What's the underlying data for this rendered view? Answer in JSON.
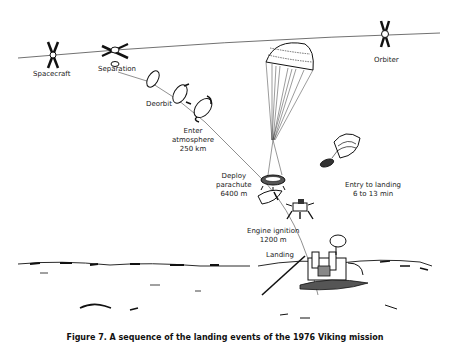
{
  "diagram": {
    "type": "landing-sequence-illustration",
    "stages": [
      {
        "id": "spacecraft",
        "label": "Spacecraft"
      },
      {
        "id": "separation",
        "label": "Separation"
      },
      {
        "id": "deorbit",
        "label": "Deorbit"
      },
      {
        "id": "enter-atmosphere",
        "label_lines": [
          "Enter",
          "atmosphere",
          "250 km"
        ]
      },
      {
        "id": "deploy-parachute",
        "label_lines": [
          "Deploy",
          "parachute",
          "6400 m"
        ]
      },
      {
        "id": "engine-ignition",
        "label_lines": [
          "Engine ignition",
          "1200 m"
        ]
      },
      {
        "id": "landing",
        "label": "Landing"
      },
      {
        "id": "orbiter",
        "label": "Orbiter"
      }
    ],
    "duration_note": {
      "line1": "Entry to landing",
      "line2": "6 to 13 min"
    },
    "caption": "Figure 7. A sequence of the landing events of the 1976 Viking mission"
  },
  "colors": {
    "ink": "#1a1a1a",
    "background": "#ffffff"
  }
}
